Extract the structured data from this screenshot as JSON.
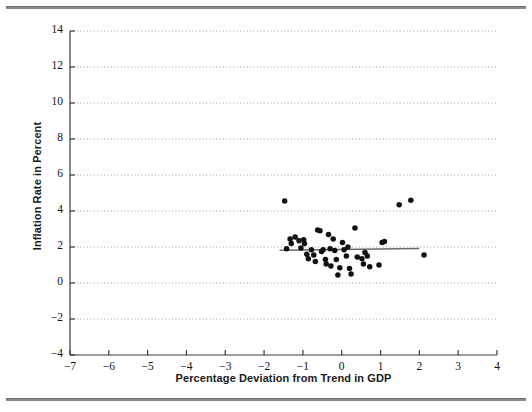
{
  "figure": {
    "background_color": "#ffffff",
    "rule_color": "#8a8a8a"
  },
  "chart_data": {
    "type": "scatter",
    "title": "",
    "xlabel": "Percentage Deviation from Trend in GDP",
    "ylabel": "Inflation Rate in Percent",
    "xlim": [
      -7,
      4
    ],
    "ylim": [
      -4,
      14
    ],
    "xticks": [
      -7,
      -6,
      -5,
      -4,
      -3,
      -2,
      -1,
      0,
      1,
      2,
      3,
      4
    ],
    "xtick_labels": [
      "−7",
      "−6",
      "−5",
      "−4",
      "−3",
      "−2",
      "−1",
      "0",
      "1",
      "2",
      "3",
      "4"
    ],
    "yticks": [
      -4,
      -2,
      0,
      2,
      4,
      6,
      8,
      10,
      12,
      14
    ],
    "ytick_labels": [
      "−4",
      "−2",
      "0",
      "2",
      "4",
      "6",
      "8",
      "10",
      "12",
      "14"
    ],
    "grid": "horizontal-dotted",
    "grid_color": "#9a9a9a",
    "legend": "none",
    "marker_color": "#111111",
    "marker_size": 4.4,
    "points": [
      {
        "x": -1.47,
        "y": 4.55
      },
      {
        "x": -1.42,
        "y": 1.9
      },
      {
        "x": -1.33,
        "y": 2.45
      },
      {
        "x": -1.3,
        "y": 2.2
      },
      {
        "x": -1.2,
        "y": 2.55
      },
      {
        "x": -1.1,
        "y": 2.35
      },
      {
        "x": -1.05,
        "y": 1.95
      },
      {
        "x": -0.98,
        "y": 2.4
      },
      {
        "x": -0.96,
        "y": 2.2
      },
      {
        "x": -0.9,
        "y": 1.6
      },
      {
        "x": -0.86,
        "y": 1.35
      },
      {
        "x": -0.78,
        "y": 1.85
      },
      {
        "x": -0.72,
        "y": 1.55
      },
      {
        "x": -0.68,
        "y": 1.2
      },
      {
        "x": -0.62,
        "y": 2.95
      },
      {
        "x": -0.56,
        "y": 2.9
      },
      {
        "x": -0.52,
        "y": 1.75
      },
      {
        "x": -0.48,
        "y": 1.85
      },
      {
        "x": -0.42,
        "y": 1.3
      },
      {
        "x": -0.4,
        "y": 1.05
      },
      {
        "x": -0.34,
        "y": 2.7
      },
      {
        "x": -0.3,
        "y": 1.9
      },
      {
        "x": -0.28,
        "y": 0.95
      },
      {
        "x": -0.22,
        "y": 2.45
      },
      {
        "x": -0.18,
        "y": 1.8
      },
      {
        "x": -0.14,
        "y": 1.3
      },
      {
        "x": -0.1,
        "y": 0.45
      },
      {
        "x": -0.05,
        "y": 0.85
      },
      {
        "x": 0.02,
        "y": 2.25
      },
      {
        "x": 0.06,
        "y": 1.85
      },
      {
        "x": 0.12,
        "y": 1.5
      },
      {
        "x": 0.16,
        "y": 2.0
      },
      {
        "x": 0.2,
        "y": 0.8
      },
      {
        "x": 0.24,
        "y": 0.5
      },
      {
        "x": 0.34,
        "y": 3.05
      },
      {
        "x": 0.4,
        "y": 1.45
      },
      {
        "x": 0.52,
        "y": 1.35
      },
      {
        "x": 0.56,
        "y": 1.05
      },
      {
        "x": 0.6,
        "y": 1.7
      },
      {
        "x": 0.66,
        "y": 1.5
      },
      {
        "x": 0.72,
        "y": 0.9
      },
      {
        "x": 0.96,
        "y": 1.0
      },
      {
        "x": 1.04,
        "y": 2.25
      },
      {
        "x": 1.1,
        "y": 2.3
      },
      {
        "x": 1.48,
        "y": 4.35
      },
      {
        "x": 1.78,
        "y": 4.6
      },
      {
        "x": 2.12,
        "y": 1.55
      }
    ],
    "trend_line": {
      "name": "regression-line",
      "color": "#6b6b6b",
      "x_start": -1.6,
      "x_end": 2.0,
      "y_start": 1.82,
      "y_end": 1.92
    }
  }
}
